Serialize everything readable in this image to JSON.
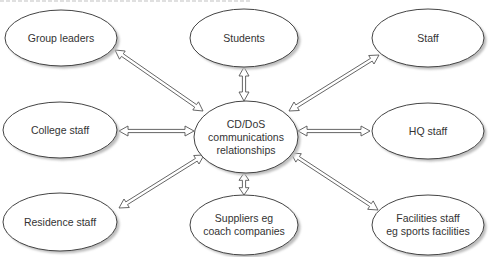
{
  "diagram": {
    "type": "hub-and-spoke",
    "colors": {
      "ellipse_stroke": "#444444",
      "ellipse_fill": "#ffffff",
      "shadow": "#bdbdbd",
      "text": "#333333",
      "arrow_stroke": "#555555"
    },
    "hub": {
      "id": "center",
      "lines": [
        "CD/DoS",
        "communications",
        "relationships"
      ],
      "cx": 246,
      "cy": 137,
      "rx": 52,
      "ry": 36
    },
    "nodes": [
      {
        "id": "group-leaders",
        "lines": [
          "Group leaders"
        ],
        "cx": 61,
        "cy": 38,
        "rx": 56,
        "ry": 28
      },
      {
        "id": "students",
        "lines": [
          "Students"
        ],
        "cx": 244,
        "cy": 38,
        "rx": 54,
        "ry": 29
      },
      {
        "id": "staff",
        "lines": [
          "Staff"
        ],
        "cx": 428,
        "cy": 38,
        "rx": 56,
        "ry": 29
      },
      {
        "id": "college-staff",
        "lines": [
          "College staff"
        ],
        "cx": 60,
        "cy": 130,
        "rx": 57,
        "ry": 28
      },
      {
        "id": "hq-staff",
        "lines": [
          "HQ staff"
        ],
        "cx": 428,
        "cy": 131,
        "rx": 56,
        "ry": 28
      },
      {
        "id": "residence-staff",
        "lines": [
          "Residence staff"
        ],
        "cx": 60,
        "cy": 222,
        "rx": 57,
        "ry": 29
      },
      {
        "id": "suppliers",
        "lines": [
          "Suppliers  eg",
          "coach companies"
        ],
        "cx": 244,
        "cy": 225,
        "rx": 54,
        "ry": 30
      },
      {
        "id": "facilities-staff",
        "lines": [
          "Facilities staff",
          "eg sports facilities"
        ],
        "cx": 428,
        "cy": 225,
        "rx": 56,
        "ry": 30
      }
    ],
    "connections": [
      {
        "from": "group-leaders",
        "to": "center",
        "x1": 115,
        "y1": 50,
        "x2": 203,
        "y2": 111,
        "bidirectional": true
      },
      {
        "from": "students",
        "to": "center",
        "x1": 244,
        "y1": 67,
        "x2": 244,
        "y2": 101,
        "bidirectional": true
      },
      {
        "from": "staff",
        "to": "center",
        "x1": 379,
        "y1": 55,
        "x2": 289,
        "y2": 111,
        "bidirectional": true
      },
      {
        "from": "college-staff",
        "to": "center",
        "x1": 119,
        "y1": 131,
        "x2": 194,
        "y2": 131,
        "bidirectional": true
      },
      {
        "from": "hq-staff",
        "to": "center",
        "x1": 370,
        "y1": 131,
        "x2": 298,
        "y2": 131,
        "bidirectional": true
      },
      {
        "from": "residence-staff",
        "to": "center",
        "x1": 119,
        "y1": 208,
        "x2": 204,
        "y2": 155,
        "bidirectional": true
      },
      {
        "from": "suppliers",
        "to": "center",
        "x1": 244,
        "y1": 195,
        "x2": 244,
        "y2": 173,
        "bidirectional": true
      },
      {
        "from": "facilities-staff",
        "to": "center",
        "x1": 378,
        "y1": 210,
        "x2": 291,
        "y2": 153,
        "bidirectional": true
      }
    ]
  }
}
